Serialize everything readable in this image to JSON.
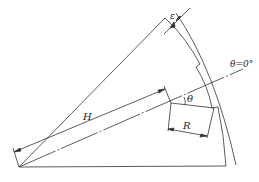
{
  "diagram": {
    "type": "engineering-drawing",
    "labels": {
      "epsilon": "ε",
      "theta_zero": "θ=0°",
      "theta": "θ",
      "H": "H",
      "R": "R"
    },
    "colors": {
      "stroke": "#333333",
      "background": "#ffffff"
    }
  }
}
